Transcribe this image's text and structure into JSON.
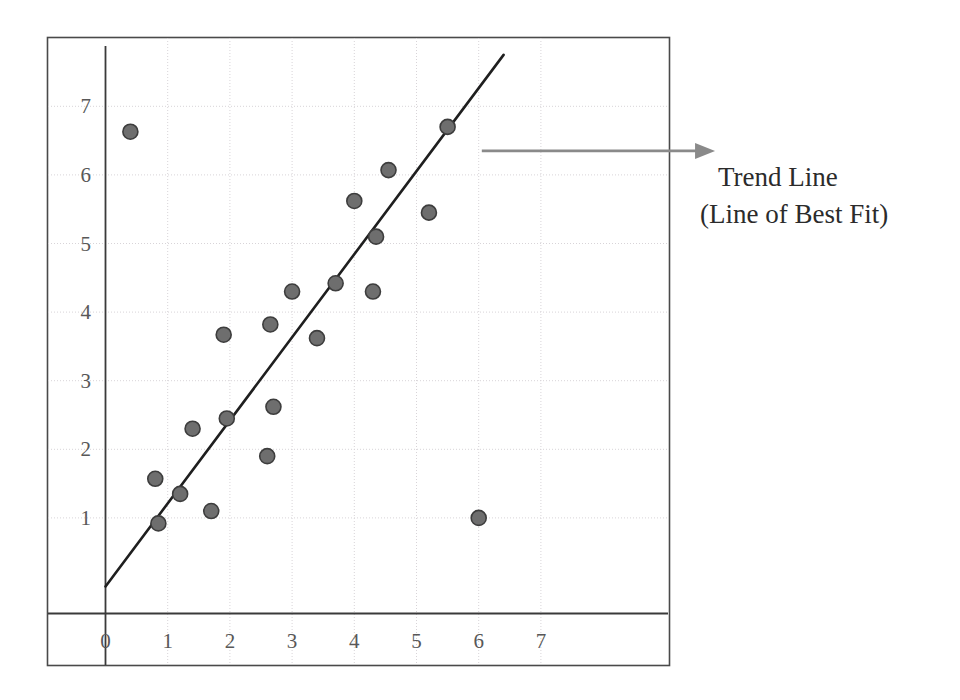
{
  "chart_data": {
    "type": "scatter",
    "title": "",
    "xlabel": "",
    "ylabel": "",
    "xlim": [
      -0.35,
      7.9
    ],
    "ylim": [
      -0.4,
      7.9
    ],
    "grid": true,
    "legend_position": "none",
    "x_ticks": [
      0,
      1,
      2,
      3,
      4,
      5,
      6,
      7
    ],
    "y_ticks": [
      1,
      2,
      3,
      4,
      5,
      6,
      7
    ],
    "x_tick_labels": [
      "0",
      "1",
      "2",
      "3",
      "4",
      "5",
      "6",
      "7"
    ],
    "y_tick_labels": [
      "1",
      "2",
      "3",
      "4",
      "5",
      "6",
      "7"
    ],
    "marker_color": "#6e6e6e",
    "marker_edge_color": "#3d3d3d",
    "marker_size": 15,
    "series": [
      {
        "name": "Data Points",
        "points": [
          {
            "x": 0.4,
            "y": 6.63
          },
          {
            "x": 0.8,
            "y": 1.57
          },
          {
            "x": 0.85,
            "y": 0.92
          },
          {
            "x": 1.2,
            "y": 1.35
          },
          {
            "x": 1.4,
            "y": 2.3
          },
          {
            "x": 1.7,
            "y": 1.1
          },
          {
            "x": 1.9,
            "y": 3.67
          },
          {
            "x": 1.95,
            "y": 2.45
          },
          {
            "x": 2.6,
            "y": 1.9
          },
          {
            "x": 2.65,
            "y": 3.82
          },
          {
            "x": 2.7,
            "y": 2.62
          },
          {
            "x": 3.0,
            "y": 4.3
          },
          {
            "x": 3.4,
            "y": 3.62
          },
          {
            "x": 3.7,
            "y": 4.42
          },
          {
            "x": 4.0,
            "y": 5.62
          },
          {
            "x": 4.3,
            "y": 4.3
          },
          {
            "x": 4.35,
            "y": 5.1
          },
          {
            "x": 4.55,
            "y": 6.07
          },
          {
            "x": 5.2,
            "y": 5.45
          },
          {
            "x": 5.5,
            "y": 6.7
          },
          {
            "x": 6.0,
            "y": 1.0
          }
        ]
      }
    ],
    "trend_line": {
      "label": "Trend Line",
      "color": "#1f1f1f",
      "x_start": 0.0,
      "y_start": 0.0,
      "x_end": 6.4,
      "y_end": 7.75
    },
    "annotations": [
      {
        "name": "trend-line-callout",
        "line1": "Trend Line",
        "line2": "(Line of Best Fit)",
        "arrow_color": "#8a8a8a",
        "arrow_from_x": 6.05,
        "arrow_from_y": 6.35,
        "arrow_to_x": 9.8,
        "arrow_to_y": 6.35
      }
    ],
    "axis_color": "#3a3a3a",
    "grid_color": "#d8d4d8",
    "frame_color": "#4a4a4a"
  },
  "figure": {
    "frame": {
      "left": 47,
      "top": 37,
      "right": 670,
      "bottom": 666
    }
  }
}
